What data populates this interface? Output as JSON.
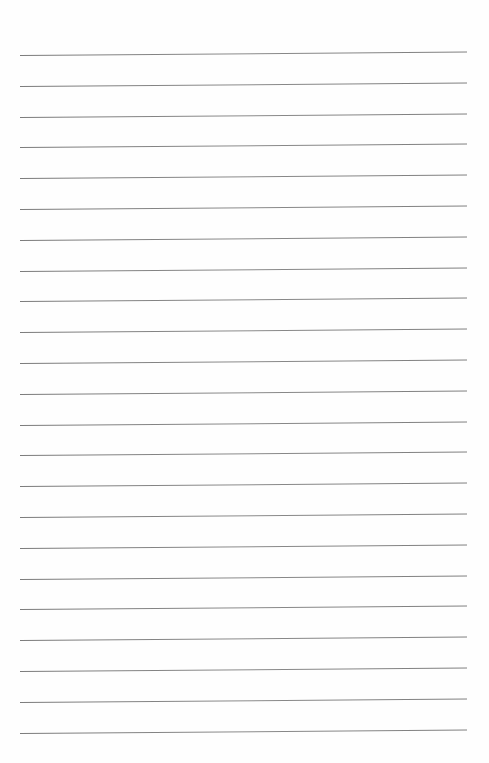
{
  "page": {
    "type": "lined-paper",
    "background_color": "#fefefe",
    "line_color": "#808080",
    "line_count": 23,
    "line_start_x": 20,
    "line_end_x": 467,
    "first_line_y": 55,
    "line_spacing": 30.8
  }
}
